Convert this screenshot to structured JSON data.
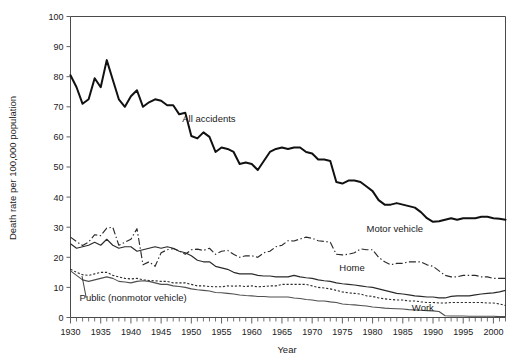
{
  "figure": {
    "background": "#ffffff",
    "ink": "#111111"
  },
  "chart_data": {
    "type": "line",
    "title": "",
    "xlabel": "Year",
    "ylabel": "Death rate per 100,000 population",
    "xlim": [
      1930,
      2002
    ],
    "ylim": [
      0,
      100
    ],
    "ytick_step": 10,
    "xtick_major_step": 5,
    "xtick_minor_step": 1,
    "grid": false,
    "legend_position": "inline-annotations",
    "yticks": [
      0,
      10,
      20,
      30,
      40,
      50,
      60,
      70,
      80,
      90,
      100
    ],
    "xticks": [
      1930,
      1935,
      1940,
      1945,
      1950,
      1955,
      1960,
      1965,
      1970,
      1975,
      1980,
      1985,
      1990,
      1995,
      2000
    ],
    "x": [
      1930,
      1931,
      1932,
      1933,
      1934,
      1935,
      1936,
      1937,
      1938,
      1939,
      1940,
      1941,
      1942,
      1943,
      1944,
      1945,
      1946,
      1947,
      1948,
      1949,
      1950,
      1951,
      1952,
      1953,
      1954,
      1955,
      1956,
      1957,
      1958,
      1959,
      1960,
      1961,
      1962,
      1963,
      1964,
      1965,
      1966,
      1967,
      1968,
      1969,
      1970,
      1971,
      1972,
      1973,
      1974,
      1975,
      1976,
      1977,
      1978,
      1979,
      1980,
      1981,
      1982,
      1983,
      1984,
      1985,
      1986,
      1987,
      1988,
      1989,
      1990,
      1991,
      1992,
      1993,
      1994,
      1995,
      1996,
      1997,
      1998,
      1999,
      2000,
      2001,
      2002
    ],
    "series": [
      {
        "name": "All accidents",
        "style": "solid-thick",
        "label_x": 1948.5,
        "label_y": 65.0,
        "values": [
          80.5,
          76.5,
          71.0,
          72.5,
          79.5,
          76.5,
          85.5,
          79.0,
          72.5,
          70.0,
          73.5,
          75.5,
          70.0,
          71.5,
          72.5,
          72.0,
          70.5,
          70.5,
          67.5,
          68.0,
          60.3,
          59.5,
          61.5,
          60.0,
          55.0,
          56.5,
          56.0,
          55.0,
          51.0,
          51.5,
          51.0,
          49.0,
          52.0,
          55.0,
          56.0,
          56.5,
          56.0,
          56.5,
          56.5,
          55.0,
          54.5,
          52.5,
          52.5,
          52.0,
          45.0,
          44.5,
          45.5,
          45.5,
          45.0,
          43.5,
          42.0,
          39.0,
          37.5,
          37.5,
          38.0,
          37.5,
          37.0,
          36.5,
          35.0,
          33.0,
          31.8,
          32.0,
          32.5,
          33.0,
          32.5,
          33.0,
          33.0,
          33.0,
          33.5,
          33.5,
          33.0,
          32.8,
          32.5
        ]
      },
      {
        "name": "Motor vehicle",
        "style": "dash-dot",
        "label_x": 1979.0,
        "label_y": 28.5,
        "values": [
          26.7,
          25.2,
          23.9,
          25.1,
          27.5,
          27.2,
          29.7,
          30.0,
          24.0,
          25.0,
          26.0,
          29.5,
          17.5,
          18.5,
          17.0,
          21.5,
          22.5,
          22.9,
          22.1,
          21.0,
          22.5,
          22.7,
          22.3,
          23.0,
          21.0,
          22.0,
          22.3,
          21.0,
          20.0,
          20.5,
          20.5,
          20.0,
          21.5,
          22.0,
          23.5,
          24.0,
          25.5,
          25.4,
          26.1,
          26.7,
          26.3,
          25.5,
          25.3,
          25.0,
          21.0,
          20.8,
          21.0,
          21.5,
          22.8,
          22.5,
          22.5,
          20.0,
          18.5,
          17.5,
          18.0,
          18.0,
          18.5,
          18.5,
          18.5,
          17.5,
          17.0,
          15.5,
          14.0,
          13.5,
          13.5,
          14.0,
          14.0,
          14.0,
          13.5,
          13.5,
          13.0,
          13.0,
          13.0
        ]
      },
      {
        "name": "Home",
        "style": "solid-thin",
        "label_x": 1974.5,
        "label_y": 15.5,
        "values": [
          24.5,
          23.0,
          23.5,
          24.0,
          25.0,
          24.0,
          26.0,
          24.0,
          23.0,
          23.5,
          23.5,
          22.0,
          22.5,
          23.0,
          23.5,
          23.0,
          23.5,
          23.0,
          22.0,
          21.5,
          20.5,
          19.0,
          18.5,
          18.5,
          17.0,
          16.5,
          16.0,
          15.0,
          14.5,
          14.5,
          14.5,
          14.0,
          13.8,
          13.8,
          13.5,
          13.5,
          13.5,
          14.0,
          13.5,
          13.2,
          13.0,
          12.5,
          12.2,
          12.0,
          11.5,
          11.2,
          11.0,
          10.8,
          10.5,
          10.2,
          10.0,
          9.5,
          9.0,
          8.5,
          8.0,
          7.8,
          7.5,
          7.2,
          7.0,
          6.8,
          6.8,
          6.5,
          6.5,
          7.0,
          7.2,
          7.2,
          7.2,
          7.5,
          7.8,
          8.0,
          8.2,
          8.5,
          9.0
        ]
      },
      {
        "name": "Public (nonmotor vehicle)",
        "style": "dotted",
        "label_x": 1931.5,
        "label_y": 5.5,
        "values": [
          16.0,
          15.0,
          14.2,
          14.0,
          14.5,
          15.0,
          15.0,
          14.0,
          13.5,
          13.0,
          12.8,
          13.0,
          12.5,
          12.3,
          12.2,
          12.0,
          12.0,
          11.5,
          11.5,
          11.5,
          11.0,
          10.5,
          10.5,
          10.3,
          10.2,
          10.2,
          10.5,
          10.4,
          10.5,
          10.3,
          10.5,
          10.2,
          10.3,
          10.5,
          10.5,
          11.0,
          11.0,
          11.0,
          11.0,
          11.0,
          10.5,
          10.0,
          9.8,
          9.5,
          9.0,
          8.5,
          8.2,
          8.0,
          7.8,
          7.2,
          7.0,
          6.5,
          6.2,
          6.0,
          5.8,
          5.8,
          5.5,
          5.5,
          5.2,
          5.0,
          5.0,
          4.8,
          4.8,
          5.0,
          5.0,
          5.0,
          5.0,
          5.0,
          5.0,
          4.8,
          4.8,
          4.5,
          4.0
        ]
      },
      {
        "name": "Work",
        "style": "solid-thin-gray",
        "label_x": 1986.5,
        "label_y": 2.0,
        "values": [
          15.5,
          14.0,
          12.5,
          12.0,
          12.5,
          13.0,
          13.5,
          13.0,
          12.0,
          11.8,
          11.5,
          12.0,
          12.2,
          12.0,
          11.5,
          11.0,
          11.0,
          10.5,
          10.3,
          10.0,
          9.5,
          9.2,
          9.0,
          8.8,
          8.3,
          8.2,
          8.0,
          7.8,
          7.5,
          7.3,
          7.2,
          7.0,
          7.0,
          6.8,
          6.8,
          6.8,
          6.8,
          6.5,
          6.3,
          6.0,
          5.8,
          5.5,
          5.5,
          5.2,
          5.0,
          4.5,
          4.3,
          4.2,
          4.0,
          3.8,
          3.5,
          3.3,
          3.1,
          3.0,
          2.9,
          2.8,
          2.6,
          2.5,
          2.4,
          2.3,
          2.2,
          2.0,
          0.6,
          0.5,
          0.5,
          0.5,
          0.4,
          0.4,
          0.4,
          0.4,
          0.4,
          0.3,
          0.3
        ]
      }
    ]
  },
  "labels": {
    "all_accidents": "All accidents",
    "motor_vehicle": "Motor vehicle",
    "home": "Home",
    "public": "Public (nonmotor vehicle)",
    "work": "Work",
    "ylabel": "Death rate per 100,000 population",
    "xlabel": "Year"
  }
}
